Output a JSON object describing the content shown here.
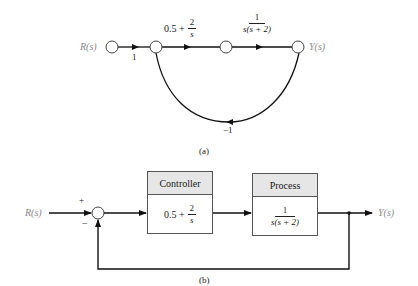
{
  "figure_a": {
    "caption": "(a)",
    "type": "signal-flow graph",
    "input_label": "R(s)",
    "output_label": "Y(s)",
    "branches": [
      {
        "from": "R(s)",
        "to": "node-2",
        "gain": "1"
      },
      {
        "from": "node-2",
        "to": "node-3",
        "gain_text": "0.5 +",
        "gain_num": "2",
        "gain_den": "s"
      },
      {
        "from": "node-3",
        "to": "Y(s)",
        "gain_num": "1",
        "gain_den": "s(s + 2)"
      },
      {
        "from": "Y(s)",
        "to": "node-2",
        "gain": "−1"
      }
    ]
  },
  "figure_b": {
    "caption": "(b)",
    "type": "block diagram",
    "input_label": "R(s)",
    "output_label": "Y(s)",
    "summing_junction": {
      "plus_sign": "+",
      "minus_sign": "−"
    },
    "controller": {
      "title": "Controller",
      "tf_text": "0.5 +",
      "tf_num": "2",
      "tf_den": "s"
    },
    "process": {
      "title": "Process",
      "tf_num": "1",
      "tf_den": "s(s + 2)"
    }
  }
}
